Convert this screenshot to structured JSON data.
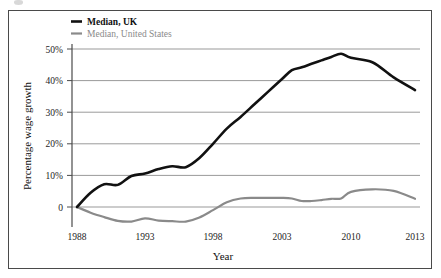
{
  "figure": {
    "background_color": "#ffffff",
    "border_color": "#4a4a4a"
  },
  "chart_data": {
    "type": "line",
    "title": "",
    "xlabel": "Year",
    "ylabel": "Percentage wage growth",
    "xlim": [
      1988,
      2013
    ],
    "ylim": [
      -6,
      50
    ],
    "grid": true,
    "grid_axis": "y",
    "legend_position": "top-left",
    "x_tick_labels": [
      "1988",
      "1993",
      "1998",
      "2003",
      "2010",
      "2013"
    ],
    "x_tick_values": [
      1988,
      1993,
      1998,
      2003,
      2010,
      2013
    ],
    "y_tick_labels": [
      "0",
      "10%",
      "20%",
      "30%",
      "40%",
      "50%"
    ],
    "y_tick_values": [
      0,
      10,
      20,
      30,
      40,
      50
    ],
    "x": [
      1988,
      1989,
      1990,
      1991,
      1992,
      1993,
      1994,
      1995,
      1996,
      1997,
      1998,
      1999,
      2000,
      2001,
      2002,
      2003,
      2004,
      2005,
      2006,
      2007,
      2008,
      2009,
      2010,
      2011,
      2012,
      2013
    ],
    "series": [
      {
        "name": "Median, UK",
        "color": "#111111",
        "width": 2.6,
        "values": [
          0,
          4.5,
          7.2,
          7.0,
          9.8,
          10.6,
          12.0,
          12.9,
          12.6,
          15.5,
          20.0,
          24.8,
          28.5,
          32.5,
          36.5,
          40.5,
          43.3,
          44.2,
          45.3,
          46.4,
          47.5,
          48.5,
          47.2,
          45.8,
          41.0,
          37.0
        ]
      },
      {
        "name": "Median, United States",
        "color": "#8a8a8a",
        "width": 2.2,
        "values": [
          0,
          -1.8,
          -3.2,
          -4.4,
          -4.6,
          -3.6,
          -4.3,
          -4.5,
          -4.6,
          -3.3,
          -1.0,
          1.5,
          2.7,
          2.9,
          2.9,
          2.9,
          2.7,
          1.9,
          1.9,
          2.2,
          2.6,
          2.7,
          4.8,
          5.6,
          5.1,
          2.6
        ]
      }
    ],
    "legend": [
      {
        "label": "Median, UK",
        "color": "#111111",
        "bold": true
      },
      {
        "label": "Median, United States",
        "color": "#8a8a8a",
        "bold": false
      }
    ]
  }
}
